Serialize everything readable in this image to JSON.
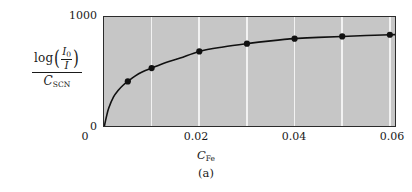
{
  "figure": {
    "caption": "(a)",
    "background_color": "#ffffff",
    "plot_background_color": "#c6c6c6",
    "gridline_color": "#f2f2f2",
    "frame_color": "#2b2b2b",
    "curve_color": "#111111",
    "marker_color": "#111111"
  },
  "ylabel": {
    "log_text": "log",
    "paren_open": "(",
    "paren_close": ")",
    "numerator_symbol": "I",
    "numerator_subscript": "0",
    "denominator_symbol": "I",
    "fraction_denominator_symbol": "C",
    "fraction_denominator_subscript": "SCN"
  },
  "xlabel": {
    "symbol": "C",
    "subscript": "Fe"
  },
  "yticks": [
    {
      "label": "1000",
      "value": 1000
    },
    {
      "label": "0",
      "value": 0
    }
  ],
  "xticks": [
    {
      "label": "0",
      "value": 0,
      "left_px": 85
    },
    {
      "label": "0.02",
      "value": 0.02,
      "left_px": 170
    },
    {
      "label": "0.04",
      "value": 0.04,
      "left_px": 268
    },
    {
      "label": "0.06",
      "value": 0.06,
      "left_px": 366
    }
  ],
  "gridlines_x": [
    0.01,
    0.02,
    0.03,
    0.04,
    0.05,
    0.06
  ],
  "chart_data": {
    "type": "line",
    "title": "",
    "subtitle": "",
    "caption": "(a)",
    "xlabel": "C_Fe",
    "ylabel": "log(I_0/I) / C_SCN",
    "xlim": [
      0,
      0.0615
    ],
    "ylim": [
      0,
      1000
    ],
    "grid": true,
    "grid_axis": "x",
    "legend": false,
    "series": [
      {
        "name": "log(I0/I)/C_SCN vs C_Fe",
        "marker": "filled-circle",
        "x": [
          0.005,
          0.01,
          0.02,
          0.03,
          0.04,
          0.05,
          0.06
        ],
        "y": [
          420,
          540,
          690,
          760,
          805,
          825,
          840
        ]
      }
    ],
    "curve_x": [
      0.0,
      0.0005,
      0.001,
      0.002,
      0.003,
      0.004,
      0.005,
      0.0065,
      0.008,
      0.01,
      0.013,
      0.016,
      0.02,
      0.025,
      0.03,
      0.035,
      0.04,
      0.045,
      0.05,
      0.055,
      0.06,
      0.0615
    ],
    "curve_y": [
      0,
      100,
      180,
      280,
      340,
      385,
      420,
      468,
      505,
      540,
      590,
      630,
      690,
      730,
      760,
      785,
      805,
      816,
      825,
      833,
      840,
      842
    ]
  }
}
